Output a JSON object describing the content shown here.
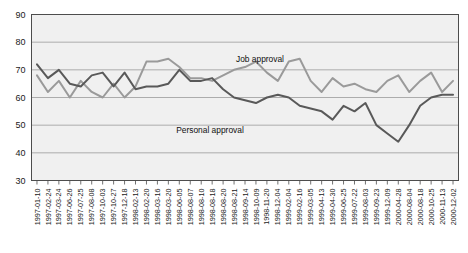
{
  "chart_data": {
    "type": "line",
    "title": "",
    "subtitle": "",
    "xlabel": "",
    "ylabel": "",
    "ylim": [
      30,
      90
    ],
    "yticks": [
      30,
      40,
      50,
      60,
      70,
      80,
      90
    ],
    "grid": true,
    "legend_position": "inline-annotation",
    "background_color": "#f0f0f0",
    "frame_color": "#4d4d4d",
    "categories": [
      "1997-01-10",
      "1997-02-24",
      "1997-03-24",
      "1997-06-26",
      "1997-07-25",
      "1997-08-08",
      "1997-10-03",
      "1997-10-27",
      "1997-12-18",
      "1998-02-13",
      "1998-02-20",
      "1998-03-16",
      "1998-03-20",
      "1998-06-05",
      "1998-08-07",
      "1998-08-10",
      "1998-08-18",
      "1998-08-20",
      "1998-08-21",
      "1998-09-14",
      "1998-10-09",
      "1998-11-20",
      "1998-12-04",
      "1999-02-04",
      "1999-02-16",
      "1999-03-05",
      "1999-04-13",
      "1999-04-30",
      "1999-06-25",
      "1999-07-22",
      "1999-08-03",
      "1999-09-23",
      "1999-12-09",
      "2000-04-28",
      "2000-08-04",
      "2000-08-18",
      "2000-10-25",
      "2000-11-13",
      "2000-12-02"
    ],
    "series": [
      {
        "name": "Job approval",
        "color": "#9a9a9a",
        "label": "Job approval",
        "label_x": 260,
        "label_y": 62,
        "values": [
          68,
          62,
          66,
          60,
          66,
          62,
          60,
          65,
          60,
          64,
          73,
          73,
          74,
          71,
          67,
          67,
          66,
          68,
          70,
          71,
          73,
          69,
          66,
          73,
          74,
          66,
          62,
          67,
          64,
          65,
          63,
          62,
          66,
          68,
          62,
          66,
          69,
          62,
          66
        ]
      },
      {
        "name": "Personal approval",
        "color": "#595959",
        "label": "Personal approval",
        "label_x": 210,
        "label_y": 133,
        "values": [
          72,
          67,
          70,
          65,
          64,
          68,
          69,
          64,
          69,
          63,
          64,
          64,
          65,
          70,
          66,
          66,
          67,
          63,
          60,
          59,
          58,
          60,
          61,
          60,
          57,
          56,
          55,
          52,
          57,
          55,
          58,
          50,
          47,
          44,
          50,
          57,
          60,
          61,
          61
        ]
      }
    ]
  },
  "axis": {
    "y_tick_labels": [
      "90",
      "80",
      "70",
      "60",
      "50",
      "40",
      "30"
    ],
    "x_tick_labels": [
      "1997-01-10",
      "1997-02-24",
      "1997-03-24",
      "1997-06-26",
      "1997-07-25",
      "1997-08-08",
      "1997-10-03",
      "1997-10-27",
      "1997-12-18",
      "1998-02-13",
      "1998-02-20",
      "1998-03-16",
      "1998-03-20",
      "1998-06-05",
      "1998-08-07",
      "1998-08-10",
      "1998-08-18",
      "1998-08-20",
      "1998-08-21",
      "1998-09-14",
      "1998-10-09",
      "1998-11-20",
      "1998-12-04",
      "1999-02-04",
      "1999-02-16",
      "1999-03-05",
      "1999-04-13",
      "1999-04-30",
      "1999-06-25",
      "1999-07-22",
      "1999-08-03",
      "1999-09-23",
      "1999-12-09",
      "2000-04-28",
      "2000-08-04",
      "2000-08-18",
      "2000-10-25",
      "2000-11-13",
      "2000-12-02"
    ]
  }
}
